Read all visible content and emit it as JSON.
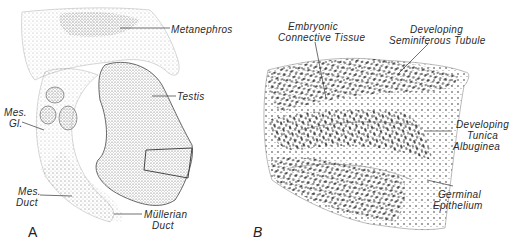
{
  "figure": {
    "panels": [
      {
        "id": "A",
        "letter": "A",
        "labels": {
          "metanephros": "Metanephros",
          "testis": "Testis",
          "mes_gl_1": "Mes.",
          "mes_gl_2": "Gl.",
          "mes_duct_1": "Mes.",
          "mes_duct_2": "Duct",
          "mullerian_1": "Müllerian",
          "mullerian_2": "Duct"
        }
      },
      {
        "id": "B",
        "letter": "B",
        "labels": {
          "embryonic_1": "Embryonic",
          "embryonic_2": "Connective Tissue",
          "seminiferous_1": "Developing",
          "seminiferous_2": "Seminiferous Tubule",
          "tunica_1": "Developing",
          "tunica_2": "Tunica",
          "tunica_3": "Albuginea",
          "germinal_1": "Germinal",
          "germinal_2": "Epithelium"
        }
      }
    ],
    "colors": {
      "ink": "#2a2a2a",
      "stipple": "#555555",
      "background": "#ffffff"
    }
  }
}
